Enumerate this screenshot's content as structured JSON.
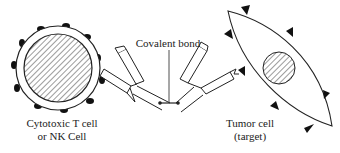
{
  "diagram": {
    "labels": {
      "tcell_line1": "Cytotoxic T cell",
      "tcell_line2": "or NK Cell",
      "bond": "Covalent bond",
      "tumor_line1": "Tumor cell",
      "tumor_line2": "(target)"
    },
    "components": [
      {
        "id": "effector-cell",
        "name": "Cytotoxic T cell or NK Cell",
        "shape": "circle",
        "nucleus": "hatched",
        "surface_markers": "dark bumps"
      },
      {
        "id": "bispecific-antibody",
        "name": "Bispecific antibody construct",
        "parts": [
          "left Fab arm",
          "right Fab arm"
        ],
        "linker": "Covalent bond"
      },
      {
        "id": "target-cell",
        "name": "Tumor cell (target)",
        "shape": "lens",
        "nucleus": "hatched",
        "surface_markers": "triangular antigens"
      }
    ],
    "colors": {
      "stroke": "#222222",
      "marker_fill": "#111111",
      "background": "#ffffff"
    }
  }
}
